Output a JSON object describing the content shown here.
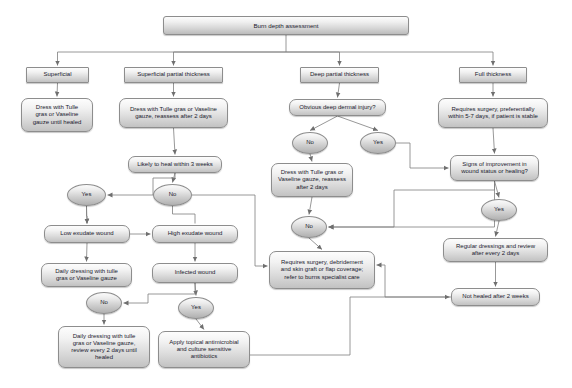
{
  "diagram": {
    "title": "Burn depth assessment",
    "style": {
      "edge_color": "#7d7d7d",
      "box_border": "#8d8d8d",
      "text_color": "#1a1a2e",
      "background": "#ffffff"
    },
    "nodes": [
      {
        "id": "root",
        "label": "Burn depth assessment",
        "shape": "head",
        "x": 163,
        "y": 16,
        "w": 246,
        "h": 19,
        "fs": 6.2
      },
      {
        "id": "superficial",
        "label": "Superficial",
        "shape": "rect",
        "x": 26,
        "y": 67,
        "w": 63,
        "h": 16,
        "fs": 6.0
      },
      {
        "id": "supPartial",
        "label": "Superficial partial thickness",
        "shape": "rect",
        "x": 124,
        "y": 67,
        "w": 99,
        "h": 16,
        "fs": 6.0
      },
      {
        "id": "deepPartial",
        "label": "Deep partial thickness",
        "shape": "rect",
        "x": 300,
        "y": 67,
        "w": 79,
        "h": 16,
        "fs": 6.0
      },
      {
        "id": "fullThick",
        "label": "Full thickness",
        "shape": "rect",
        "x": 459,
        "y": 67,
        "w": 68,
        "h": 16,
        "fs": 6.0
      },
      {
        "id": "dressSup",
        "label": "Dress with Tulle\ngras or Vaseline\ngauze until healed",
        "shape": "round",
        "x": 21,
        "y": 98,
        "w": 72,
        "h": 34,
        "fs": 6.0
      },
      {
        "id": "dressSPT",
        "label": "Dress with Tulle gras or Vaseline\ngauze, reassess after 2 days",
        "shape": "round",
        "x": 119,
        "y": 98,
        "w": 109,
        "h": 30,
        "fs": 6.0
      },
      {
        "id": "likelyHeal",
        "label": "Likely to heal within 3 weeks",
        "shape": "round",
        "x": 128,
        "y": 156,
        "w": 94,
        "h": 17,
        "fs": 6.0
      },
      {
        "id": "obvDermal",
        "label": "Obvious deep dermal injury?",
        "shape": "round",
        "x": 289,
        "y": 99,
        "w": 97,
        "h": 17,
        "fs": 6.0
      },
      {
        "id": "reqSurgery",
        "label": "Requires surgery, preferentially\nwithin 5-7 days, if patient is stable",
        "shape": "round",
        "x": 438,
        "y": 98,
        "w": 110,
        "h": 30,
        "fs": 6.0
      },
      {
        "id": "yesDermal",
        "label": "Yes",
        "shape": "pill",
        "x": 360,
        "y": 132,
        "w": 36,
        "h": 22,
        "fs": 6.0
      },
      {
        "id": "noDermal",
        "label": "No",
        "shape": "pill",
        "x": 292,
        "y": 132,
        "w": 36,
        "h": 22,
        "fs": 6.0
      },
      {
        "id": "signsImp",
        "label": "Signs of improvement in\nwound status or healing?",
        "shape": "round",
        "x": 450,
        "y": 155,
        "w": 89,
        "h": 26,
        "fs": 6.0
      },
      {
        "id": "dressDeep",
        "label": "Dress with Tulle gras or\nVaseline gauze, reassess\nafter 2 days",
        "shape": "round",
        "x": 271,
        "y": 163,
        "w": 82,
        "h": 34,
        "fs": 6.0
      },
      {
        "id": "yesHeal",
        "label": "Yes",
        "shape": "pill",
        "x": 67,
        "y": 184,
        "w": 39,
        "h": 22,
        "fs": 6.0
      },
      {
        "id": "noHeal",
        "label": "No",
        "shape": "pill",
        "x": 153,
        "y": 184,
        "w": 39,
        "h": 22,
        "fs": 6.0
      },
      {
        "id": "yesImp",
        "label": "Yes",
        "shape": "pill",
        "x": 481,
        "y": 199,
        "w": 36,
        "h": 22,
        "fs": 6.0
      },
      {
        "id": "lowExudate",
        "label": "Low exudate wound",
        "shape": "round",
        "x": 44,
        "y": 225,
        "w": 86,
        "h": 18,
        "fs": 6.0
      },
      {
        "id": "highExudate",
        "label": "High exudate wound",
        "shape": "round",
        "x": 152,
        "y": 225,
        "w": 86,
        "h": 18,
        "fs": 6.0
      },
      {
        "id": "noImp",
        "label": "No",
        "shape": "pill",
        "x": 291,
        "y": 216,
        "w": 36,
        "h": 22,
        "fs": 6.0
      },
      {
        "id": "regDress",
        "label": "Regular dressings and review\nafter every 2 days",
        "shape": "round",
        "x": 443,
        "y": 238,
        "w": 105,
        "h": 24,
        "fs": 6.0
      },
      {
        "id": "dailyLow",
        "label": "Daily dressing with tulle\ngras or Vaseline gauze",
        "shape": "round",
        "x": 41,
        "y": 263,
        "w": 91,
        "h": 24,
        "fs": 6.0
      },
      {
        "id": "infected",
        "label": "Infected wound",
        "shape": "round",
        "x": 152,
        "y": 263,
        "w": 86,
        "h": 20,
        "fs": 6.0
      },
      {
        "id": "reqSurgDeb",
        "label": "Requires surgery, debridement\nand skin graft or flap coverage;\nrefer to burns specialist care",
        "shape": "round",
        "x": 269,
        "y": 251,
        "w": 106,
        "h": 38,
        "fs": 6.0
      },
      {
        "id": "notHealed",
        "label": "Not healed after 2 weeks",
        "shape": "round",
        "x": 451,
        "y": 288,
        "w": 89,
        "h": 18,
        "fs": 6.0
      },
      {
        "id": "noInfect",
        "label": "No",
        "shape": "pill",
        "x": 86,
        "y": 292,
        "w": 36,
        "h": 22,
        "fs": 6.0
      },
      {
        "id": "yesInfect",
        "label": "Yes",
        "shape": "pill",
        "x": 178,
        "y": 297,
        "w": 36,
        "h": 22,
        "fs": 6.0
      },
      {
        "id": "dailyReview",
        "label": "Daily dressing with tulle\ngras or Vaseline gauze,\nreview every 2 days until\nhealed",
        "shape": "round",
        "x": 58,
        "y": 326,
        "w": 92,
        "h": 42,
        "fs": 6.0
      },
      {
        "id": "applyAnti",
        "label": "Apply topical antimicrobial\nand culture sensitive\nantibiotics",
        "shape": "round",
        "x": 158,
        "y": 331,
        "w": 92,
        "h": 37,
        "fs": 6.0
      }
    ],
    "edges": [
      {
        "from": "root",
        "to": "superficial"
      },
      {
        "from": "root",
        "to": "supPartial"
      },
      {
        "from": "root",
        "to": "deepPartial"
      },
      {
        "from": "root",
        "to": "fullThick"
      },
      {
        "from": "superficial",
        "to": "dressSup"
      },
      {
        "from": "supPartial",
        "to": "dressSPT"
      },
      {
        "from": "dressSPT",
        "to": "likelyHeal"
      },
      {
        "from": "likelyHeal",
        "to": "yesHeal"
      },
      {
        "from": "likelyHeal",
        "to": "noHeal"
      },
      {
        "from": "deepPartial",
        "to": "obvDermal"
      },
      {
        "from": "obvDermal",
        "to": "noDermal"
      },
      {
        "from": "obvDermal",
        "to": "yesDermal"
      },
      {
        "from": "noDermal",
        "to": "dressDeep"
      },
      {
        "from": "fullThick",
        "to": "reqSurgery"
      },
      {
        "from": "reqSurgery",
        "to": "signsImp"
      },
      {
        "from": "yesDermal",
        "to": "signsImp"
      },
      {
        "from": "signsImp",
        "to": "yesImp"
      },
      {
        "from": "signsImp",
        "to": "noImp"
      },
      {
        "from": "yesHeal",
        "to": "lowExudate"
      },
      {
        "from": "noHeal",
        "to": "highExudate"
      },
      {
        "from": "noHeal",
        "to": "reqSurgDeb"
      },
      {
        "from": "lowExudate",
        "to": "highExudate"
      },
      {
        "from": "lowExudate",
        "to": "dailyLow"
      },
      {
        "from": "highExudate",
        "to": "infected"
      },
      {
        "from": "dressDeep",
        "to": "noImp"
      },
      {
        "from": "noImp",
        "to": "reqSurgDeb"
      },
      {
        "from": "yesImp",
        "to": "regDress"
      },
      {
        "from": "regDress",
        "to": "notHealed"
      },
      {
        "from": "notHealed",
        "to": "reqSurgDeb"
      },
      {
        "from": "infected",
        "to": "noInfect"
      },
      {
        "from": "infected",
        "to": "yesInfect"
      },
      {
        "from": "noInfect",
        "to": "dailyReview"
      },
      {
        "from": "yesInfect",
        "to": "applyAnti"
      },
      {
        "from": "applyAnti",
        "to": "notHealed"
      }
    ]
  }
}
